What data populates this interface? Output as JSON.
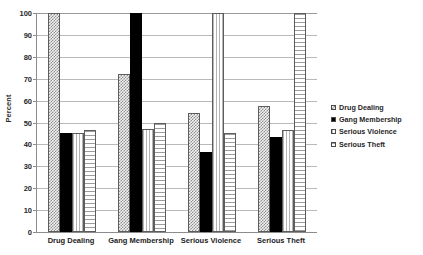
{
  "chart_data": {
    "type": "bar",
    "title": "",
    "xlabel": "",
    "ylabel": "Percent",
    "ylim": [
      0,
      100
    ],
    "ytick_step": 10,
    "yticks": [
      0,
      10,
      20,
      30,
      40,
      50,
      60,
      70,
      80,
      90,
      100
    ],
    "grid": true,
    "legend_position": "right",
    "categories": [
      "Drug Dealing",
      "Gang Membership",
      "Serious Violence",
      "Serious Theft"
    ],
    "series": [
      {
        "name": "Drug Dealing",
        "pattern": "checkered-dots",
        "values": [
          100,
          72,
          54.5,
          57.5
        ]
      },
      {
        "name": "Gang Membership",
        "pattern": "solid-black",
        "values": [
          45,
          100,
          36.5,
          43.5
        ]
      },
      {
        "name": "Serious Violence",
        "pattern": "fine-vertical-lines",
        "values": [
          45.2,
          47,
          100,
          46.5
        ]
      },
      {
        "name": "Serious Theft",
        "pattern": "horizontal-lines",
        "values": [
          46.5,
          50,
          45,
          100
        ]
      }
    ]
  },
  "axis": {
    "y_title": "Percent",
    "y_tick_labels": [
      "100",
      "90",
      "80",
      "70",
      "60",
      "50",
      "40",
      "30",
      "20",
      "10",
      "0"
    ],
    "x_tick_labels": [
      "Drug Dealing",
      "Gang Membership",
      "Serious Violence",
      "Serious Theft"
    ]
  },
  "legend": {
    "items": [
      {
        "label": "Drug Dealing",
        "pattern": "checkered-dots"
      },
      {
        "label": "Gang Membership",
        "pattern": "solid-black"
      },
      {
        "label": "Serious Violence",
        "pattern": "fine-vertical-lines"
      },
      {
        "label": "Serious Theft",
        "pattern": "horizontal-lines"
      }
    ]
  },
  "colors": {
    "background": "#ffffff",
    "gridline": "#b9b9b9",
    "axis": "#8c8c8c",
    "text": "#212121",
    "bar_outline": "#5d5d5d",
    "solid_fill": "#000000"
  }
}
